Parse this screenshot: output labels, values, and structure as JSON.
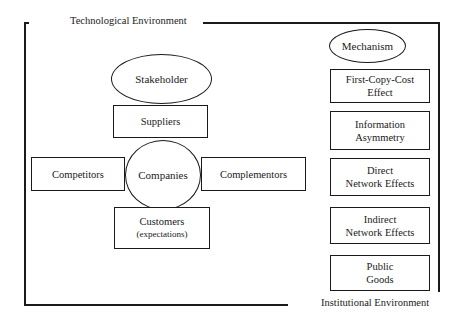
{
  "environments": {
    "technological": "Technological Environment",
    "institutional": "Institutional Environment"
  },
  "stakeholder": {
    "title": "Stakeholder",
    "center": "Companies",
    "top": "Suppliers",
    "left": "Competitors",
    "right": "Complementors",
    "bottom_line1": "Customers",
    "bottom_line2": "(expectations)"
  },
  "mechanism": {
    "title": "Mechanism",
    "items": [
      "First-Copy-Cost\nEffect",
      "Information\nAsymmetry",
      "Direct\nNetwork Effects",
      "Indirect\nNetwork Effects",
      "Public\nGoods"
    ]
  }
}
